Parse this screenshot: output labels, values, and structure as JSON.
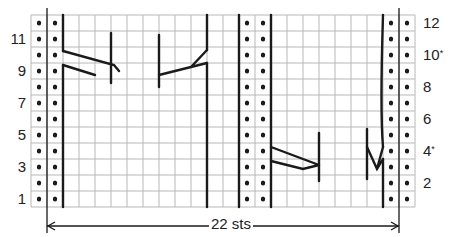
{
  "chart": {
    "rows": 12,
    "columns": 24,
    "grid": {
      "left": 31,
      "top": 15,
      "cell": 16
    },
    "colors": {
      "grid": "#b8b8b8",
      "line": "#1a1a1a",
      "dot": "#1a1a1a"
    },
    "purl_columns": [
      0,
      1,
      13,
      14,
      22,
      23
    ],
    "left_row_labels": [
      {
        "row": 1,
        "text": "1"
      },
      {
        "row": 3,
        "text": "3"
      },
      {
        "row": 5,
        "text": "5"
      },
      {
        "row": 7,
        "text": "7"
      },
      {
        "row": 9,
        "text": "9"
      },
      {
        "row": 11,
        "text": "11"
      }
    ],
    "right_row_labels": [
      {
        "row": 2,
        "text": "2",
        "mark": ""
      },
      {
        "row": 4,
        "text": "4",
        "mark": "*"
      },
      {
        "row": 6,
        "text": "6",
        "mark": ""
      },
      {
        "row": 8,
        "text": "8",
        "mark": ""
      },
      {
        "row": 10,
        "text": "10",
        "mark": "*"
      },
      {
        "row": 12,
        "text": "12",
        "mark": ""
      }
    ],
    "repeat_label": "22 sts",
    "stitch_count": 22,
    "symbols": {
      "purl": "dot",
      "knit": "blank",
      "cable": "cross-lines"
    }
  }
}
